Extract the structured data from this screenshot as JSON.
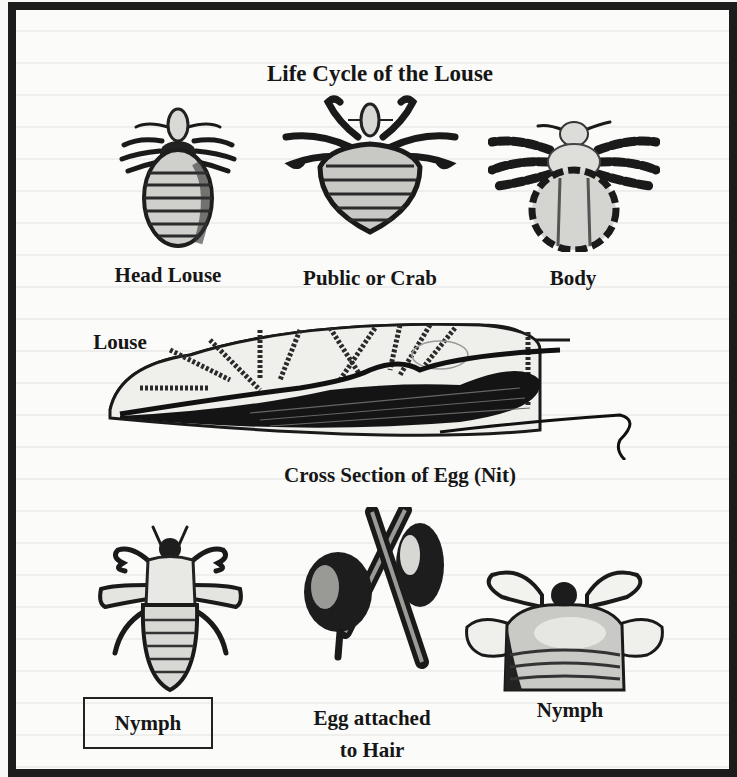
{
  "figure": {
    "title": "Life Cycle of the Louse",
    "frame_color": "#1c1c1c",
    "background_color": "#fbfbfa",
    "adults": [
      {
        "label": "Head Louse",
        "icon": "head-louse-illustration"
      },
      {
        "label": "Public or Crab",
        "icon": "crab-louse-illustration"
      },
      {
        "label": "Body",
        "icon": "body-louse-illustration"
      }
    ],
    "louse_label": "Louse",
    "egg_cross_section": {
      "label": "Cross Section of Egg (Nit)",
      "icon": "egg-cross-section-illustration"
    },
    "bottom_row": [
      {
        "label": "Nymph",
        "boxed": true,
        "icon": "nymph-illustration"
      },
      {
        "label_line1": "Egg attached",
        "label_line2": "to Hair",
        "icon": "egg-on-hair-illustration"
      },
      {
        "label": "Nymph",
        "boxed": false,
        "icon": "nymph-crab-illustration"
      }
    ]
  }
}
